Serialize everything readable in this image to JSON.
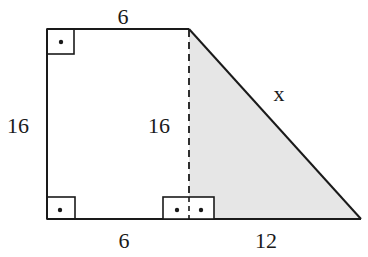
{
  "diagram": {
    "type": "geometry-figure",
    "colors": {
      "stroke": "#1a1a1a",
      "shade": "#e6e6e6",
      "background": "#ffffff"
    },
    "labels": {
      "top": "6",
      "left": "16",
      "height": "16",
      "bottom_left": "6",
      "bottom_right": "12",
      "hypotenuse": "x"
    },
    "right_angle_markers": [
      {
        "position": "top-left",
        "symbol": "dot"
      },
      {
        "position": "bottom-left",
        "symbol": "dot"
      },
      {
        "position": "bottom-foot-of-height",
        "symbol": "double-dot"
      }
    ],
    "shaded_region": "right triangle with legs 16 and 12, hypotenuse x"
  }
}
